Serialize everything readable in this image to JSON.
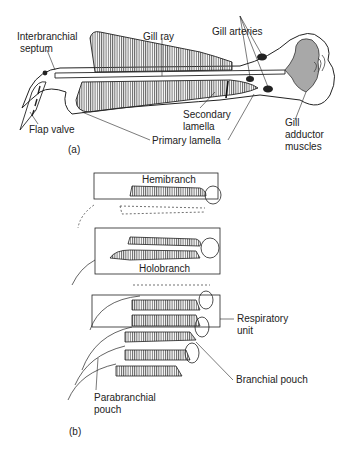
{
  "figure": {
    "part_a": {
      "caption": "(a)",
      "labels": {
        "interbranchial_septum_1": "Interbranchial",
        "interbranchial_septum_2": "septum",
        "gill_ray": "Gill ray",
        "gill_arteries": "Gill arteries",
        "flap_valve": "Flap valve",
        "secondary_lamella_1": "Secondary",
        "secondary_lamella_2": "lamella",
        "primary_lamella": "Primary lamella",
        "gill_adductor_1": "Gill",
        "gill_adductor_2": "adductor",
        "gill_adductor_3": "muscles"
      }
    },
    "part_b": {
      "caption": "(b)",
      "labels": {
        "hemibranch": "Hemibranch",
        "holobranch": "Holobranch",
        "respiratory_unit_1": "Respiratory",
        "respiratory_unit_2": "unit",
        "branchial_pouch": "Branchial pouch",
        "parabranchial_pouch_1": "Parabranchial",
        "parabranchial_pouch_2": "pouch"
      }
    },
    "colors": {
      "line": "#222222",
      "muscle_fill": "#a8a8a8",
      "hatch": "#555555"
    }
  }
}
